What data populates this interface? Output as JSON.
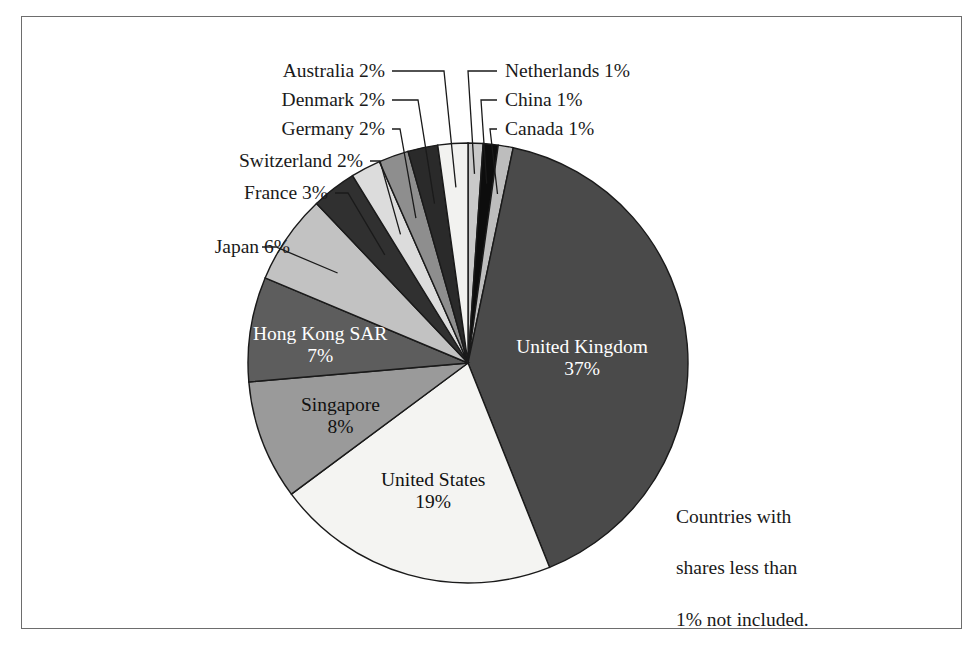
{
  "chart_data": {
    "type": "pie",
    "title": "",
    "subtitle": "",
    "xlabel": "",
    "ylabel": "",
    "units": "percent",
    "note": "Countries with\nshares less than\n1% not included.",
    "legend_position": "callout-labels",
    "grid": false,
    "start_angle_deg": 0,
    "direction": "clockwise",
    "categories": [
      "Netherlands",
      "China",
      "Canada",
      "United Kingdom",
      "United States",
      "Singapore",
      "Hong Kong SAR",
      "Japan",
      "France",
      "Switzerland",
      "Germany",
      "Denmark",
      "Australia"
    ],
    "values": [
      1,
      1,
      1,
      37,
      19,
      8,
      7,
      6,
      3,
      2,
      2,
      2,
      2
    ],
    "labels": [
      "Netherlands 1%",
      "China 1%",
      "Canada 1%",
      "United Kingdom 37%",
      "United States 19%",
      "Singapore 8%",
      "Hong Kong SAR 7%",
      "Japan 6%",
      "France 3%",
      "Switzerland 2%",
      "Germany 2%",
      "Denmark 2%",
      "Australia 2%"
    ],
    "colors": [
      "#c9c9c9",
      "#0d0d0d",
      "#bdbdbd",
      "#4a4a4a",
      "#f4f4f2",
      "#9a9a9a",
      "#5d5d5d",
      "#c2c2c2",
      "#303030",
      "#dcdcdc",
      "#8e8e8e",
      "#2a2a2a",
      "#f2f2f0"
    ]
  },
  "slice_labels": [
    {
      "name": "United Kingdom",
      "line1": "United Kingdom",
      "line2": "37%",
      "tone": "light"
    },
    {
      "name": "United States",
      "line1": "United States",
      "line2": "19%",
      "tone": "dark"
    },
    {
      "name": "Singapore",
      "line1": "Singapore",
      "line2": "8%",
      "tone": "dark"
    },
    {
      "name": "Hong Kong SAR",
      "line1": "Hong Kong SAR",
      "line2": "7%",
      "tone": "light"
    }
  ],
  "callouts": {
    "left": [
      {
        "name": "australia",
        "text": "Australia 2%"
      },
      {
        "name": "denmark",
        "text": "Denmark 2%"
      },
      {
        "name": "germany",
        "text": "Germany 2%"
      },
      {
        "name": "switzerland",
        "text": "Switzerland 2%"
      },
      {
        "name": "france",
        "text": "France 3%"
      },
      {
        "name": "japan",
        "text": "Japan 6%"
      }
    ],
    "right": [
      {
        "name": "netherlands",
        "text": "Netherlands 1%"
      },
      {
        "name": "china",
        "text": "China 1%"
      },
      {
        "name": "canada",
        "text": "Canada 1%"
      }
    ]
  },
  "note": {
    "line1": "Countries with",
    "line2": "shares less than",
    "line3": "1% not included."
  },
  "colors": {
    "frame_border": "#6d6d6d",
    "slice_outline": "#1a1a1a",
    "leader_line": "#1a1a1a",
    "background": "#ffffff",
    "text": "#1a1a1a"
  }
}
